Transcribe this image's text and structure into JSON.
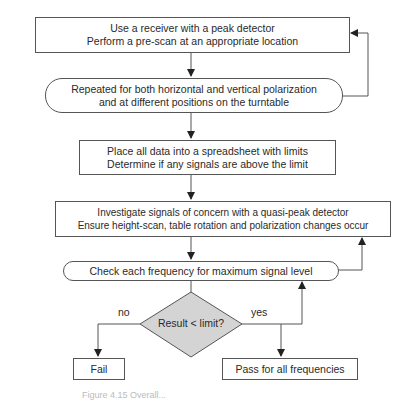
{
  "flowchart": {
    "nodes": [
      {
        "id": "prescan",
        "shape": "rect",
        "lines": [
          "Use a receiver with a peak detector",
          "Perform a pre-scan at an appropriate location"
        ]
      },
      {
        "id": "repeat",
        "shape": "rounded",
        "lines": [
          "Repeated for both horizontal and vertical polarization",
          "and at different positions on the turntable"
        ]
      },
      {
        "id": "spreadsheet",
        "shape": "rect",
        "lines": [
          "Place all data into a spreadsheet with limits",
          "Determine if any signals are above the limit"
        ]
      },
      {
        "id": "investigate",
        "shape": "rect",
        "lines": [
          "Investigate signals of concern with a quasi-peak detector",
          "Ensure height-scan, table rotation and polarization changes occur"
        ]
      },
      {
        "id": "check",
        "shape": "rounded",
        "lines": [
          "Check each frequency for maximum signal level"
        ]
      },
      {
        "id": "decision",
        "shape": "diamond",
        "lines": [
          "Result < limit?"
        ]
      },
      {
        "id": "fail",
        "shape": "rect",
        "lines": [
          "Fail"
        ]
      },
      {
        "id": "pass",
        "shape": "rect",
        "lines": [
          "Pass for all frequencies"
        ]
      }
    ],
    "edge_labels": {
      "no": "no",
      "yes": "yes"
    },
    "colors": {
      "stroke": "#555555",
      "diamond_fill": "#d4d4d4"
    }
  },
  "caption": "Figure 4.15  Overall..."
}
